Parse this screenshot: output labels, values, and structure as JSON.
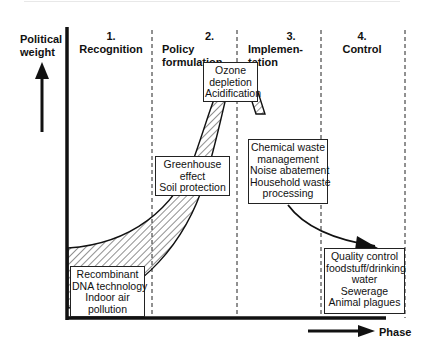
{
  "diagram": {
    "y_axis_label": [
      "Political",
      "weight"
    ],
    "x_axis_label": "Phase",
    "phases": [
      {
        "number": "1.",
        "title_lines": [
          "Recognition"
        ]
      },
      {
        "number": "2.",
        "title_lines": [
          "Policy",
          "formulation"
        ]
      },
      {
        "number": "3.",
        "title_lines": [
          "Implemen-",
          "tation"
        ]
      },
      {
        "number": "4.",
        "title_lines": [
          "Control"
        ]
      }
    ],
    "boxes": {
      "recognition": [
        "Recombinant",
        "DNA technology",
        "Indoor air",
        "pollution"
      ],
      "greenhouse": [
        "Greenhouse",
        "effect",
        "Soil protection"
      ],
      "ozone": [
        "Ozone",
        "depletion",
        "Acidification"
      ],
      "implementation": [
        "Chemical waste",
        "management",
        "Noise abatement",
        "Household waste",
        "processing"
      ],
      "control": [
        "Quality control",
        "foodstuff/drinking",
        "water",
        "Sewerage",
        "Animal plagues"
      ]
    },
    "colors": {
      "ink": "#111111",
      "background": "#ffffff"
    }
  }
}
